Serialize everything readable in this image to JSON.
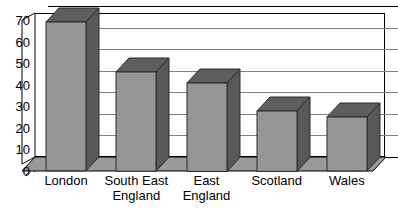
{
  "chart_data": {
    "type": "bar",
    "title": "",
    "subtitle": "",
    "xlabel": "",
    "ylabel": "",
    "categories": [
      "London",
      "South East England",
      "East England",
      "Scotland",
      "Wales"
    ],
    "values": [
      69,
      46,
      41,
      28,
      25
    ],
    "series": [
      {
        "name": "",
        "values": [
          69,
          46,
          41,
          28,
          25
        ]
      }
    ],
    "ylim": [
      0,
      70
    ],
    "ytick_labels": [
      "0",
      "10",
      "20",
      "30",
      "40",
      "50",
      "60",
      "70"
    ],
    "ytick_values": [
      0,
      10,
      20,
      30,
      40,
      50,
      60,
      70
    ],
    "grid": true,
    "grid_axis": "y",
    "legend": false,
    "legend_position": "none",
    "style_3d": true,
    "colors": {
      "bar_front": "#969696",
      "bar_top": "#5e5e5e",
      "bar_side": "#585858",
      "bar_outline": "#2b2b2b",
      "gridline": "#808080",
      "axis_line": "#000000",
      "plot_background": "#ffffff",
      "floor": "#9a9a9a",
      "wall_side": "#ffffff",
      "text": "#000000"
    }
  },
  "axis": {
    "y_ticks": [
      {
        "label": "70",
        "value": 70
      },
      {
        "label": "60",
        "value": 60
      },
      {
        "label": "50",
        "value": 50
      },
      {
        "label": "40",
        "value": 40
      },
      {
        "label": "30",
        "value": 30
      },
      {
        "label": "20",
        "value": 20
      },
      {
        "label": "10",
        "value": 10
      },
      {
        "label": "0",
        "value": 0
      }
    ]
  },
  "x_categories": [
    {
      "line1": "London",
      "line2": ""
    },
    {
      "line1": "South East",
      "line2": "England"
    },
    {
      "line1": "East England",
      "line2": ""
    },
    {
      "line1": "Scotland",
      "line2": ""
    },
    {
      "line1": "Wales",
      "line2": ""
    }
  ]
}
